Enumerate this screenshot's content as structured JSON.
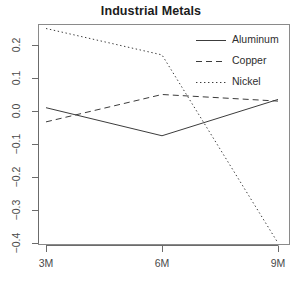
{
  "chart_data": {
    "type": "line",
    "title": "Industrial Metals",
    "xlabel": "",
    "ylabel": "",
    "x": [
      "3M",
      "6M",
      "9M"
    ],
    "categories": [
      "3M",
      "6M",
      "9M"
    ],
    "series": [
      {
        "name": "Aluminum",
        "linestyle": "solid",
        "color": "#3c3c3c",
        "values": [
          0.01,
          -0.075,
          0.035
        ]
      },
      {
        "name": "Copper",
        "linestyle": "dashed",
        "color": "#3c3c3c",
        "values": [
          -0.033,
          0.05,
          0.03
        ]
      },
      {
        "name": "Nickel",
        "linestyle": "dotted",
        "color": "#3c3c3c",
        "values": [
          0.25,
          0.17,
          -0.4
        ]
      }
    ],
    "ylim": [
      -0.4,
      0.25
    ],
    "yticks": [
      0.2,
      0.1,
      0.0,
      -0.1,
      -0.2,
      -0.3,
      -0.4
    ],
    "ytick_labels": [
      "0.2",
      "0.1",
      "0.0",
      "-0.1",
      "-0.2",
      "-0.3",
      "-0.4"
    ],
    "xtick_labels": [
      "3M",
      "6M",
      "9M"
    ],
    "grid": false,
    "legend_position": "top-right",
    "box": true
  },
  "legend": {
    "entries": [
      {
        "label": "Aluminum",
        "sample": "solid-line-sample"
      },
      {
        "label": "Copper",
        "sample": "dashed-line-sample"
      },
      {
        "label": "Nickel",
        "sample": "dotted-line-sample"
      }
    ]
  }
}
